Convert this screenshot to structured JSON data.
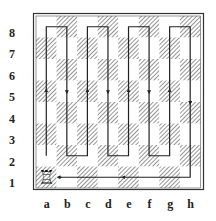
{
  "diagram": {
    "type": "chess-rook-tour",
    "board": {
      "files": [
        "a",
        "b",
        "c",
        "d",
        "e",
        "f",
        "g",
        "h"
      ],
      "ranks": [
        "8",
        "7",
        "6",
        "5",
        "4",
        "3",
        "2",
        "1"
      ],
      "light_color": "#ffffff",
      "dark_pattern": "diagonal-hatch",
      "dark_color": "#8a8a8a",
      "border_color": "#333333"
    },
    "piece": {
      "type": "rook",
      "color": "white",
      "square": "a1",
      "glyph": "♖"
    },
    "path": {
      "description": "Rook tour: a1 up a-file to a8, snake through files b-h between ranks 8 and 2, down h-file to h1, then left along rank 1 back to b1",
      "squares": [
        "a1",
        "a8",
        "b8",
        "b2",
        "c2",
        "c8",
        "d8",
        "d2",
        "e2",
        "e8",
        "f8",
        "f2",
        "g2",
        "g8",
        "h8",
        "h1",
        "b1"
      ],
      "color": "#222222"
    }
  }
}
